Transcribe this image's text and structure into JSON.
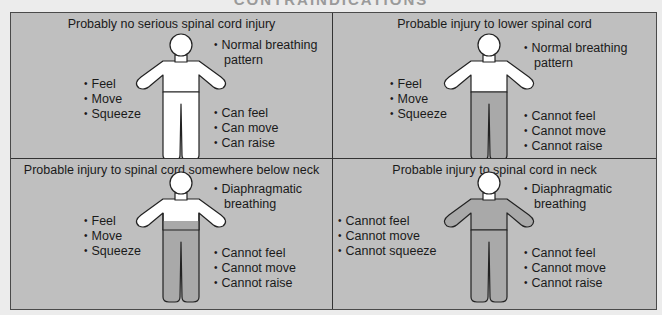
{
  "header": {
    "title": "CONTRAINDICATIONS"
  },
  "colors": {
    "panel_bg": "#bfbfbf",
    "unaffected": "#ffffff",
    "affected": "#a9a9a9",
    "outline": "#222222",
    "border": "#333333"
  },
  "panels": [
    {
      "title": "Probably no serious spinal cord injury",
      "breathing": [
        "Normal breathing",
        "pattern"
      ],
      "arms": [
        "Feel",
        "Move",
        "Squeeze"
      ],
      "legs": [
        "Can feel",
        "Can move",
        "Can raise"
      ],
      "shading": "none"
    },
    {
      "title": "Probable injury to lower spinal cord",
      "breathing": [
        "Normal breathing",
        "pattern"
      ],
      "arms": [
        "Feel",
        "Move",
        "Squeeze"
      ],
      "legs": [
        "Cannot feel",
        "Cannot move",
        "Cannot raise"
      ],
      "shading": "legs"
    },
    {
      "title": "Probable injury to spinal cord somewhere below neck",
      "breathing": [
        "Diaphragmatic",
        "breathing"
      ],
      "arms": [
        "Feel",
        "Move",
        "Squeeze"
      ],
      "legs": [
        "Cannot feel",
        "Cannot move",
        "Cannot raise"
      ],
      "shading": "lower-torso-and-legs"
    },
    {
      "title": "Probable injury to spinal cord in neck",
      "breathing": [
        "Diaphragmatic",
        "breathing"
      ],
      "arms": [
        "Cannot feel",
        "Cannot move",
        "Cannot squeeze"
      ],
      "legs": [
        "Cannot feel",
        "Cannot move",
        "Cannot raise"
      ],
      "shading": "below-neck"
    }
  ]
}
